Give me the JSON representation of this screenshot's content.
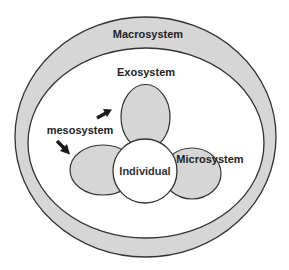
{
  "diagram": {
    "colors": {
      "background": "#ffffff",
      "fill": "#d6d6d6",
      "stroke": "#333333",
      "text": "#222222",
      "arrow": "#1a1a1a"
    },
    "layers": {
      "macrosystem": {
        "label": "Macrosystem"
      },
      "exosystem": {
        "label": "Exosystem"
      },
      "mesosystem": {
        "label": "mesosystem"
      },
      "microsystem": {
        "label": "Microsystem"
      },
      "individual": {
        "label": "Individual"
      }
    },
    "arrows": [
      {
        "name": "mesosystem-arrow-up-right",
        "direction": "up-right"
      },
      {
        "name": "mesosystem-arrow-down-right",
        "direction": "down-right"
      }
    ]
  }
}
